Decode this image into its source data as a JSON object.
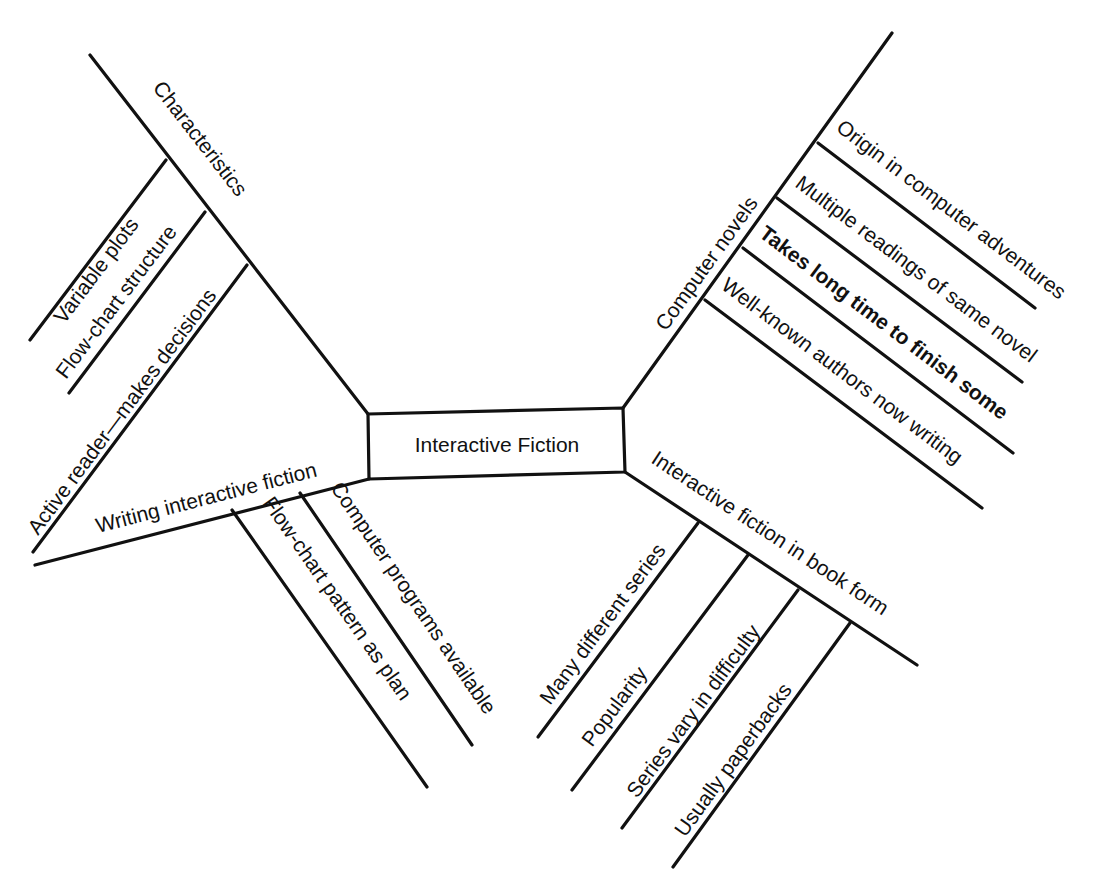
{
  "center": {
    "label": "Interactive Fiction"
  },
  "branches": [
    {
      "label": "Characteristics",
      "items": [
        "Variable plots",
        "Flow-chart structure",
        "Active reader—makes decisions"
      ]
    },
    {
      "label": "Computer novels",
      "items": [
        "Origin in computer adventures",
        "Multiple readings of same novel",
        "Takes long time to finish some",
        "Well-known authors now writing"
      ]
    },
    {
      "label": "Writing interactive fiction",
      "items": [
        "Flow-chart pattern as plan",
        "Computer programs available"
      ]
    },
    {
      "label": "Interactive fiction in book form",
      "items": [
        "Many different series",
        "Popularity",
        "Series vary in difficulty",
        "Usually paperbacks"
      ]
    }
  ],
  "colors": {
    "ink": "#111111",
    "background": "#ffffff"
  }
}
